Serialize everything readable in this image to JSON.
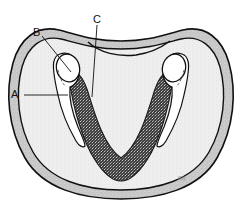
{
  "figure": {
    "type": "anatomical-cross-section",
    "background_color": "#ffffff",
    "outline_color": "#111111",
    "outer_band_color": "#c8c8c8",
    "inner_body_color": "#eeeeee",
    "canal_band_color": "#3a3a3a",
    "socket_color": "#ffffff",
    "signature_text": "mj"
  },
  "labels": [
    {
      "id": "A",
      "text": "A",
      "x": 11,
      "y": 89,
      "leader": {
        "x1": 24,
        "y1": 95,
        "x2": 68,
        "y2": 95
      }
    },
    {
      "id": "B",
      "text": "B",
      "x": 33,
      "y": 27,
      "leader": {
        "x1": 42,
        "y1": 36,
        "x2": 71,
        "y2": 72
      }
    },
    {
      "id": "C",
      "text": "C",
      "x": 93,
      "y": 14,
      "leader": {
        "x1": 97,
        "y1": 25,
        "x2": 92,
        "y2": 96
      }
    }
  ],
  "regions": [
    {
      "name": "outer-cortical-band",
      "label": "A",
      "tone": "medium-gray"
    },
    {
      "name": "tooth-socket",
      "label": "B",
      "tone": "white"
    },
    {
      "name": "stippled-canal-band",
      "label": "C",
      "tone": "dark-stipple"
    },
    {
      "name": "inner-body",
      "label": "",
      "tone": "light-gray"
    }
  ]
}
